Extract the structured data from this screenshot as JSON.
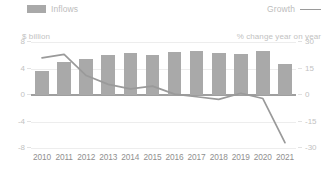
{
  "legend": {
    "bar_label": "Inflows",
    "bar_swatch_icon": "bar-swatch-icon",
    "line_label": "Growth",
    "line_swatch_icon": "line-swatch-icon"
  },
  "axes": {
    "left_unit": "$ billion",
    "right_unit": "% change year on year",
    "left_ticks": [
      "8",
      "4",
      "0",
      "-4",
      "-8"
    ],
    "right_ticks": [
      "30",
      "15",
      "0",
      "-15",
      "-30"
    ]
  },
  "colors": {
    "bar": "#a9a9a9",
    "line": "#9a9a9a",
    "grid": "#ededed",
    "zero_axis": "#9f9f9f",
    "label": "#8f8f8f",
    "muted_label": "#c2c2c2",
    "background": "#ffffff"
  },
  "chart_data": {
    "type": "bar",
    "title": "",
    "xlabel": "",
    "grid": true,
    "legend_position": "top",
    "categories": [
      "2010",
      "2011",
      "2012",
      "2013",
      "2014",
      "2015",
      "2016",
      "2017",
      "2018",
      "2019",
      "2020",
      "2021"
    ],
    "series": [
      {
        "name": "Inflows",
        "type": "bar",
        "axis": "left",
        "unit": "$ billion",
        "ylabel": "$ billion",
        "ylim": [
          -8,
          8
        ],
        "yticks": [
          8,
          4,
          0,
          -4,
          -8
        ],
        "values": [
          3.6,
          5.0,
          5.5,
          6.1,
          6.3,
          6.1,
          6.5,
          6.6,
          6.3,
          6.2,
          6.7,
          4.7
        ]
      },
      {
        "name": "Growth",
        "type": "line",
        "axis": "right",
        "unit": "% change year on year",
        "ylabel": "% change year on year",
        "ylim": [
          -30,
          30
        ],
        "yticks": [
          30,
          15,
          0,
          -15,
          -30
        ],
        "values": [
          21,
          23,
          11,
          6,
          3.5,
          5,
          0.5,
          -1,
          -2.5,
          1,
          -2,
          -27
        ]
      }
    ]
  }
}
